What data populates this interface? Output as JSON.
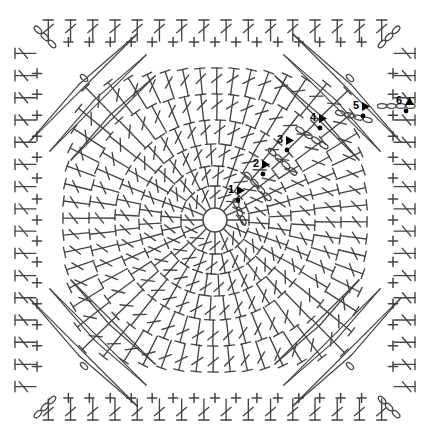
{
  "document": {
    "title": "Crochet Granny Square Stitch Diagram",
    "type": "crochet-pattern-chart",
    "background_color": "#ffffff",
    "ink_color": "#444444",
    "label_color": "#000000",
    "width": 434,
    "height": 444
  },
  "chart_data": {
    "type": "diagram",
    "subtitle": "",
    "xlabel": "",
    "ylabel": "",
    "grid": false,
    "legend_position": "none",
    "center": {
      "x": 215,
      "y": 220,
      "ring_radius": 12,
      "label": "magic-ring"
    },
    "round_labels": [
      {
        "id": 1,
        "text": "1",
        "x": 228,
        "y": 184,
        "marker": "triangle-right",
        "dot": true
      },
      {
        "id": 2,
        "text": "2",
        "x": 253,
        "y": 158,
        "marker": "triangle-right",
        "dot": true
      },
      {
        "id": 3,
        "text": "3",
        "x": 277,
        "y": 134,
        "marker": "triangle-right",
        "dot": true
      },
      {
        "id": 4,
        "text": "4",
        "x": 310,
        "y": 112,
        "marker": "triangle-right",
        "dot": true
      },
      {
        "id": 5,
        "text": "5",
        "x": 353,
        "y": 100,
        "marker": "triangle-right",
        "dot": true
      },
      {
        "id": 6,
        "text": "6",
        "x": 396,
        "y": 95,
        "marker": "triangle-up",
        "dot": true
      }
    ],
    "rounds": [
      {
        "round": 1,
        "radius": 34,
        "stitch": "double-crochet",
        "count": 16,
        "shape": "circle"
      },
      {
        "round": 2,
        "radius": 54,
        "stitch": "double-crochet",
        "count": 24,
        "shape": "circle"
      },
      {
        "round": 3,
        "radius": 76,
        "stitch": "double-crochet",
        "count": 32,
        "shape": "circle"
      },
      {
        "round": 4,
        "radius": 100,
        "stitch": "double-crochet",
        "count": 40,
        "shape": "circle"
      },
      {
        "round": 5,
        "radius": 126,
        "stitch": "double-crochet",
        "count": 48,
        "shape": "circle"
      },
      {
        "round": 6,
        "radius": 152,
        "stitch": "double-crochet",
        "count": 56,
        "shape": "circle-to-square"
      },
      {
        "round": 7,
        "half": 178,
        "stitch": "single-crochet",
        "shape": "square",
        "note": "plus symbols along square edges"
      },
      {
        "round": 8,
        "half": 200,
        "stitch": "double-crochet",
        "shape": "square",
        "note": "outer double crochet border"
      }
    ],
    "corner_chains": [
      {
        "corner": "top-left",
        "x": 52,
        "y": 44,
        "chains": 3
      },
      {
        "corner": "top-right",
        "x": 382,
        "y": 44,
        "chains": 3
      },
      {
        "corner": "bottom-left",
        "x": 52,
        "y": 400,
        "chains": 3
      },
      {
        "corner": "bottom-right",
        "x": 382,
        "y": 400,
        "chains": 3
      }
    ],
    "inner_corner_chains": [
      {
        "corner": "top-left",
        "x": 84,
        "y": 78,
        "chains": 1
      },
      {
        "corner": "top-right",
        "x": 350,
        "y": 78,
        "chains": 1
      },
      {
        "corner": "bottom-left",
        "x": 84,
        "y": 366,
        "chains": 1
      },
      {
        "corner": "bottom-right",
        "x": 350,
        "y": 366,
        "chains": 1
      }
    ],
    "chain_runs": [
      {
        "round": 1,
        "x": 236,
        "y": 203,
        "angle": 68,
        "chains": 3
      },
      {
        "round": 2,
        "x": 248,
        "y": 176,
        "angle": 47,
        "chains": 4
      },
      {
        "round": 3,
        "x": 272,
        "y": 152,
        "angle": 43,
        "chains": 4
      },
      {
        "round": 4,
        "x": 300,
        "y": 130,
        "angle": 33,
        "chains": 4
      },
      {
        "round": 5,
        "x": 340,
        "y": 113,
        "angle": 14,
        "chains": 4
      },
      {
        "round": 6,
        "x": 382,
        "y": 106,
        "angle": 0,
        "chains": 4
      }
    ],
    "symbol_legend": [
      {
        "symbol": "oval",
        "name": "chain-stitch"
      },
      {
        "symbol": "plus",
        "name": "single-crochet"
      },
      {
        "symbol": "t-with-slash",
        "name": "double-crochet"
      },
      {
        "symbol": "filled-dot",
        "name": "slip-stitch"
      },
      {
        "symbol": "filled-triangle",
        "name": "round-start-marker"
      },
      {
        "symbol": "open-circle",
        "name": "starting-ring"
      }
    ]
  }
}
